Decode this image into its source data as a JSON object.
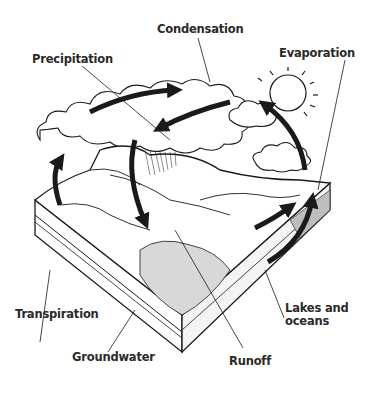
{
  "diagram": {
    "labels": {
      "condensation": "Condensation",
      "precipitation": "Precipitation",
      "evaporation": "Evaporation",
      "transpiration": "Transpiration",
      "groundwater": "Groundwater",
      "runoff": "Runoff",
      "lakes_line1": "Lakes and",
      "lakes_line2": "oceans"
    },
    "colors": {
      "ink": "#1a1a1a",
      "paper": "#ffffff",
      "label_text": "#2a2a2a"
    }
  }
}
